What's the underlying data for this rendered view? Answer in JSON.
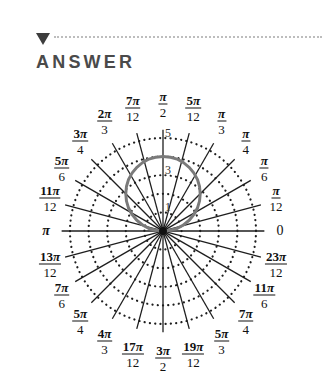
{
  "header": {
    "icon": "triangle-down-icon",
    "title": "ANSWER"
  },
  "graph": {
    "type": "polar",
    "equation_depicted": "circle r = 4 sin θ",
    "center": [
      163,
      231
    ],
    "px_per_unit": 18.6,
    "rings": [
      1,
      2,
      3,
      4,
      5
    ],
    "radial_labels": [
      {
        "value": "1",
        "r": 1.5
      },
      {
        "value": "3",
        "r": 3.5
      },
      {
        "value": "5",
        "r": 5.5
      }
    ],
    "curve": {
      "diameter": 4,
      "color": "#7a7a7a"
    },
    "spoke_count": 24,
    "spoke_extent": 5.45,
    "colors": {
      "spokes": "#1e1e1e",
      "rings": "#1e1e1e",
      "curve": "#7a7a7a"
    },
    "angle_labels": [
      {
        "angle_index": 0,
        "num": "0",
        "den": ""
      },
      {
        "angle_index": 1,
        "num": "π",
        "den": "12"
      },
      {
        "angle_index": 2,
        "num": "π",
        "den": "6"
      },
      {
        "angle_index": 3,
        "num": "π",
        "den": "4"
      },
      {
        "angle_index": 4,
        "num": "π",
        "den": "3"
      },
      {
        "angle_index": 5,
        "num": "5π",
        "den": "12"
      },
      {
        "angle_index": 6,
        "num": "π",
        "den": "2"
      },
      {
        "angle_index": 7,
        "num": "7π",
        "den": "12"
      },
      {
        "angle_index": 8,
        "num": "2π",
        "den": "3"
      },
      {
        "angle_index": 9,
        "num": "3π",
        "den": "4"
      },
      {
        "angle_index": 10,
        "num": "5π",
        "den": "6"
      },
      {
        "angle_index": 11,
        "num": "11π",
        "den": "12"
      },
      {
        "angle_index": 12,
        "num": "π",
        "den": ""
      },
      {
        "angle_index": 13,
        "num": "13π",
        "den": "12"
      },
      {
        "angle_index": 14,
        "num": "7π",
        "den": "6"
      },
      {
        "angle_index": 15,
        "num": "5π",
        "den": "4"
      },
      {
        "angle_index": 16,
        "num": "4π",
        "den": "3"
      },
      {
        "angle_index": 17,
        "num": "17π",
        "den": "12"
      },
      {
        "angle_index": 18,
        "num": "3π",
        "den": "2"
      },
      {
        "angle_index": 19,
        "num": "19π",
        "den": "12"
      },
      {
        "angle_index": 20,
        "num": "5π",
        "den": "3"
      },
      {
        "angle_index": 21,
        "num": "7π",
        "den": "4"
      },
      {
        "angle_index": 22,
        "num": "11π",
        "den": "6"
      },
      {
        "angle_index": 23,
        "num": "23π",
        "den": "12"
      }
    ]
  }
}
